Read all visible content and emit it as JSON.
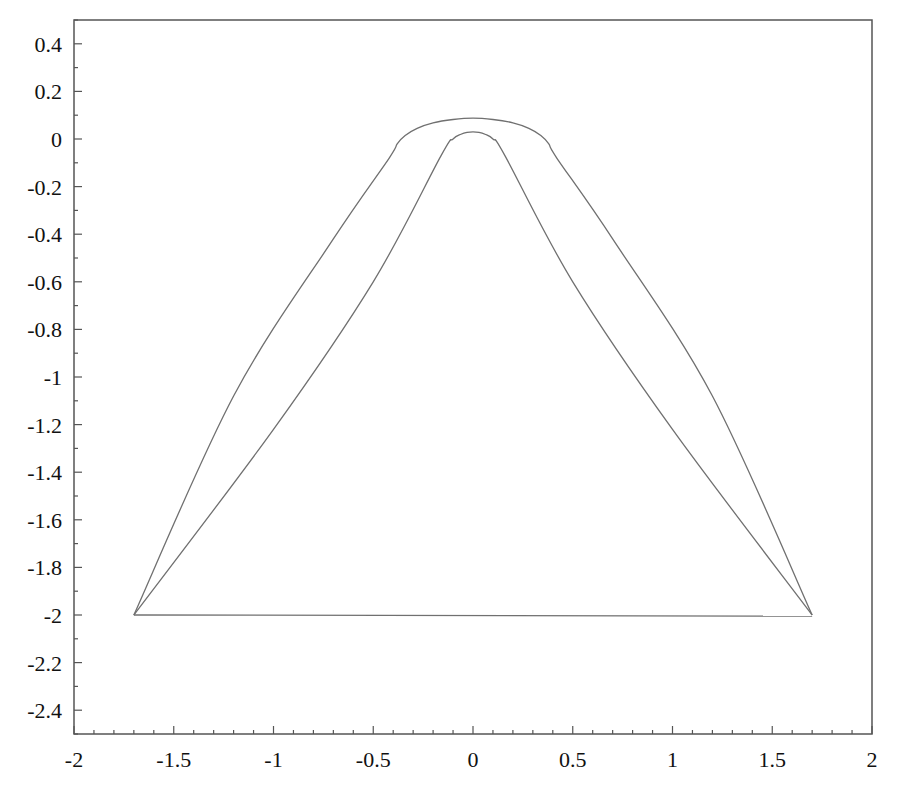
{
  "chart_data": {
    "type": "line",
    "title": "",
    "xlabel": "",
    "ylabel": "",
    "xlim": [
      -2,
      2
    ],
    "ylim": [
      -2.5,
      0.5
    ],
    "grid": false,
    "legend": null,
    "x_ticks": [
      -2,
      -1.5,
      -1,
      -0.5,
      0,
      0.5,
      1,
      1.5,
      2
    ],
    "x_tick_labels": [
      "-2",
      "-1.5",
      "-1",
      "-0.5",
      "0",
      "0.5",
      "1",
      "1.5",
      "2"
    ],
    "y_ticks": [
      0.4,
      0.2,
      0,
      -0.2,
      -0.4,
      -0.6,
      -0.8,
      -1,
      -1.2,
      -1.4,
      -1.6,
      -1.8,
      -2,
      -2.2,
      -2.4
    ],
    "y_tick_labels": [
      "0.4",
      "0.2",
      "0",
      "-0.2",
      "-0.4",
      "-0.6",
      "-0.8",
      "-1",
      "-1.2",
      "-1.4",
      "-1.6",
      "-1.8",
      "-2",
      "-2.2",
      "-2.4"
    ],
    "x_minor_step": 0.1,
    "y_minor_step": 0.1,
    "line_color": "#707070",
    "series": [
      {
        "name": "outer curve",
        "x": [
          -1.7,
          -1.2,
          -0.7,
          -0.42,
          -0.38,
          -0.34,
          -0.28,
          -0.2,
          -0.1,
          0,
          0.1,
          0.2,
          0.28,
          0.34,
          0.38,
          0.42,
          0.7,
          1.2,
          1.7
        ],
        "y": [
          -2.0,
          -1.08,
          -0.42,
          -0.08,
          -0.02,
          0.015,
          0.045,
          0.068,
          0.082,
          0.088,
          0.082,
          0.068,
          0.045,
          0.015,
          -0.02,
          -0.08,
          -0.42,
          -1.08,
          -2.0
        ]
      },
      {
        "name": "inner curve",
        "x": [
          -1.7,
          -1.0,
          -0.5,
          -0.16,
          -0.1,
          -0.06,
          -0.03,
          0,
          0.03,
          0.06,
          0.1,
          0.16,
          0.5,
          1.0,
          1.7
        ],
        "y": [
          -2.0,
          -1.22,
          -0.6,
          -0.07,
          0.0,
          0.02,
          0.028,
          0.03,
          0.028,
          0.02,
          0.0,
          -0.07,
          -0.6,
          -1.22,
          -2.0
        ]
      },
      {
        "name": "base segment",
        "x": [
          -1.7,
          1.7
        ],
        "y": [
          -2.0,
          -2.005
        ]
      }
    ]
  },
  "plot_area": {
    "left": 74,
    "top": 20,
    "right": 872,
    "bottom": 734
  }
}
